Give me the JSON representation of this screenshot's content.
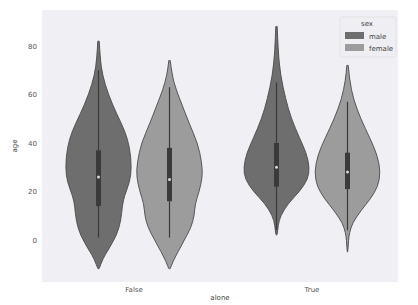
{
  "chart_data": {
    "type": "violin",
    "title": "",
    "xlabel": "alone",
    "ylabel": "age",
    "categories": [
      "False",
      "True"
    ],
    "ylim": [
      -14,
      90
    ],
    "yticks": [
      0,
      20,
      40,
      60,
      80
    ],
    "grid": false,
    "background": "#eaeaf2",
    "legend": {
      "title": "sex",
      "position": "upper right",
      "entries": [
        {
          "label": "male",
          "color": "#6e6e6e"
        },
        {
          "label": "female",
          "color": "#9c9c9c"
        }
      ]
    },
    "series": [
      {
        "name": "male",
        "color": "#6e6e6e",
        "violins": [
          {
            "category": "False",
            "min": -12,
            "max": 82,
            "q1": 14,
            "median": 26,
            "q3": 37,
            "whisker_low": 1,
            "whisker_high": 70,
            "profile": [
              [
                82,
                0.02
              ],
              [
                75,
                0.05
              ],
              [
                68,
                0.12
              ],
              [
                60,
                0.3
              ],
              [
                52,
                0.55
              ],
              [
                45,
                0.8
              ],
              [
                38,
                0.95
              ],
              [
                30,
                1.0
              ],
              [
                24,
                0.95
              ],
              [
                18,
                0.78
              ],
              [
                14,
                0.72
              ],
              [
                8,
                0.68
              ],
              [
                2,
                0.55
              ],
              [
                -4,
                0.3
              ],
              [
                -8,
                0.12
              ],
              [
                -12,
                0.02
              ]
            ]
          },
          {
            "category": "True",
            "min": 2,
            "max": 88,
            "q1": 22,
            "median": 30,
            "q3": 40,
            "whisker_low": 4,
            "whisker_high": 65,
            "profile": [
              [
                88,
                0.02
              ],
              [
                78,
                0.05
              ],
              [
                68,
                0.12
              ],
              [
                58,
                0.28
              ],
              [
                50,
                0.45
              ],
              [
                42,
                0.7
              ],
              [
                36,
                0.9
              ],
              [
                30,
                1.0
              ],
              [
                25,
                0.95
              ],
              [
                20,
                0.7
              ],
              [
                15,
                0.35
              ],
              [
                10,
                0.12
              ],
              [
                6,
                0.05
              ],
              [
                2,
                0.02
              ]
            ]
          }
        ]
      },
      {
        "name": "female",
        "color": "#9c9c9c",
        "violins": [
          {
            "category": "False",
            "min": -12,
            "max": 74,
            "q1": 16,
            "median": 25,
            "q3": 38,
            "whisker_low": 1,
            "whisker_high": 63,
            "profile": [
              [
                74,
                0.02
              ],
              [
                68,
                0.08
              ],
              [
                62,
                0.2
              ],
              [
                55,
                0.4
              ],
              [
                48,
                0.6
              ],
              [
                40,
                0.85
              ],
              [
                32,
                0.98
              ],
              [
                26,
                1.0
              ],
              [
                20,
                0.9
              ],
              [
                15,
                0.78
              ],
              [
                10,
                0.75
              ],
              [
                5,
                0.65
              ],
              [
                0,
                0.45
              ],
              [
                -5,
                0.25
              ],
              [
                -9,
                0.1
              ],
              [
                -12,
                0.02
              ]
            ]
          },
          {
            "category": "True",
            "min": -5,
            "max": 72,
            "q1": 21,
            "median": 28,
            "q3": 36,
            "whisker_low": 4,
            "whisker_high": 57,
            "profile": [
              [
                72,
                0.02
              ],
              [
                66,
                0.06
              ],
              [
                58,
                0.18
              ],
              [
                50,
                0.4
              ],
              [
                42,
                0.68
              ],
              [
                35,
                0.9
              ],
              [
                28,
                1.0
              ],
              [
                22,
                0.92
              ],
              [
                17,
                0.7
              ],
              [
                12,
                0.4
              ],
              [
                7,
                0.15
              ],
              [
                3,
                0.06
              ],
              [
                0,
                0.03
              ],
              [
                -5,
                0.01
              ]
            ]
          }
        ]
      }
    ]
  }
}
